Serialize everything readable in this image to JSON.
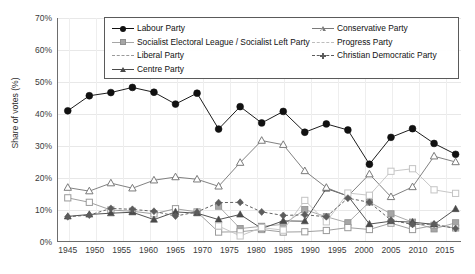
{
  "chart_data": {
    "type": "line",
    "title": "",
    "xlabel": "",
    "ylabel": "Share of votes (%)",
    "xlim": [
      1943,
      2018
    ],
    "ylim": [
      0,
      70
    ],
    "ytick_labels": [
      "0%",
      "10%",
      "20%",
      "30%",
      "40%",
      "50%",
      "60%",
      "70%"
    ],
    "ytick_values": [
      0,
      10,
      20,
      30,
      40,
      50,
      60,
      70
    ],
    "xtick_labels": [
      "1945",
      "1950",
      "1955",
      "1960",
      "1965",
      "1970",
      "1975",
      "1980",
      "1985",
      "1990",
      "1995",
      "2000",
      "2005",
      "2010",
      "2015"
    ],
    "xtick_values": [
      1945,
      1950,
      1955,
      1960,
      1965,
      1970,
      1975,
      1980,
      1985,
      1990,
      1995,
      2000,
      2005,
      2010,
      2015
    ],
    "grid": true,
    "legend_position": "upper-center",
    "election_years": [
      1945,
      1949,
      1953,
      1957,
      1961,
      1965,
      1969,
      1973,
      1977,
      1981,
      1985,
      1989,
      1993,
      1997,
      2001,
      2005,
      2009,
      2013,
      2017
    ],
    "series": [
      {
        "name": "Labour Party",
        "marker": "circle-filled",
        "color": "#111111",
        "line": "solid",
        "x": [
          1945,
          1949,
          1953,
          1957,
          1961,
          1965,
          1969,
          1973,
          1977,
          1981,
          1985,
          1989,
          1993,
          1997,
          2001,
          2005,
          2009,
          2013,
          2017
        ],
        "values": [
          41.0,
          45.7,
          46.7,
          48.3,
          46.8,
          43.1,
          46.5,
          35.3,
          42.3,
          37.2,
          40.8,
          34.3,
          36.9,
          35.0,
          24.3,
          32.7,
          35.4,
          30.8,
          27.4
        ]
      },
      {
        "name": "Socialist Electoral League / Socialist Left Party",
        "marker": "square-filled",
        "color": "#a6a6a6",
        "line": "solid",
        "x": [
          1973,
          1977,
          1981,
          1985,
          1989,
          1993,
          1997,
          2001,
          2005,
          2009,
          2013,
          2017
        ],
        "values": [
          11.2,
          4.2,
          4.9,
          5.5,
          10.1,
          7.9,
          6.0,
          12.5,
          8.8,
          6.2,
          4.1,
          6.0
        ]
      },
      {
        "name": "Liberal Party",
        "marker": "square-open",
        "color": "#9a9a9a",
        "line": "solid",
        "x": [
          1945,
          1949,
          1953,
          1957,
          1961,
          1965,
          1969,
          1973,
          1977,
          1981,
          1985,
          1989,
          1993,
          1997,
          2001,
          2005,
          2009,
          2013,
          2017
        ],
        "values": [
          13.8,
          12.4,
          10.0,
          9.6,
          8.8,
          10.4,
          9.4,
          3.1,
          3.2,
          3.9,
          3.1,
          3.2,
          3.6,
          4.5,
          3.9,
          5.9,
          3.9,
          5.2,
          4.4
        ]
      },
      {
        "name": "Centre Party",
        "marker": "triangle-filled",
        "color": "#4a4a4a",
        "line": "solid",
        "x": [
          1945,
          1949,
          1953,
          1957,
          1961,
          1965,
          1969,
          1973,
          1977,
          1981,
          1985,
          1989,
          1993,
          1997,
          2001,
          2005,
          2009,
          2013,
          2017
        ],
        "values": [
          8.0,
          8.6,
          9.0,
          9.3,
          7.0,
          9.4,
          9.0,
          7.0,
          8.6,
          4.2,
          6.6,
          6.5,
          16.7,
          14.4,
          5.6,
          6.5,
          6.2,
          5.5,
          10.3
        ]
      },
      {
        "name": "Conservative Party",
        "marker": "triangle-open",
        "color": "#7a7a7a",
        "line": "solid",
        "x": [
          1945,
          1949,
          1953,
          1957,
          1961,
          1965,
          1969,
          1973,
          1977,
          1981,
          1985,
          1989,
          1993,
          1997,
          2001,
          2005,
          2009,
          2013,
          2017
        ],
        "values": [
          17.0,
          15.9,
          18.4,
          16.8,
          19.3,
          20.3,
          19.6,
          17.4,
          24.8,
          31.7,
          30.4,
          22.2,
          17.0,
          14.3,
          21.2,
          14.1,
          17.2,
          26.8,
          25.0
        ]
      },
      {
        "name": "Progress Party",
        "marker": "square-open-light",
        "color": "#c4c4c4",
        "line": "solid",
        "x": [
          1973,
          1977,
          1981,
          1985,
          1989,
          1993,
          1997,
          2001,
          2005,
          2009,
          2013,
          2017
        ],
        "values": [
          5.0,
          1.9,
          4.5,
          3.7,
          13.0,
          6.3,
          15.3,
          14.6,
          22.1,
          22.9,
          16.3,
          15.2
        ]
      },
      {
        "name": "Christian Democratic Party",
        "marker": "diamond-filled",
        "color": "#5c5c5c",
        "line": "dashed",
        "x": [
          1945,
          1949,
          1953,
          1957,
          1961,
          1965,
          1969,
          1973,
          1977,
          1981,
          1985,
          1989,
          1993,
          1997,
          2001,
          2005,
          2009,
          2013,
          2017
        ],
        "values": [
          7.9,
          8.4,
          10.5,
          10.2,
          9.6,
          8.1,
          9.4,
          12.3,
          12.4,
          9.4,
          8.3,
          8.5,
          7.9,
          13.7,
          12.4,
          6.8,
          5.5,
          5.6,
          4.2
        ]
      }
    ]
  },
  "legend": {
    "columns": [
      {
        "items": [
          {
            "label": "Labour Party",
            "marker": "circle-filled",
            "line": "solid",
            "color": "#111111"
          },
          {
            "label": "Socialist Electoral League / Socialist Left Party",
            "marker": "square-filled",
            "line": "solid",
            "color": "#a6a6a6"
          },
          {
            "label": "Liberal Party",
            "marker": "none",
            "line": "dashdot",
            "color": "#9a9a9a"
          },
          {
            "label": "Centre Party",
            "marker": "triangle-filled",
            "line": "solid",
            "color": "#4a4a4a"
          }
        ]
      },
      {
        "items": [
          {
            "label": "Conservative Party",
            "marker": "triangle-open",
            "line": "solid",
            "color": "#7a7a7a"
          },
          {
            "label": "Progress Party",
            "marker": "none",
            "line": "dashdot",
            "color": "#bdbdbd"
          },
          {
            "label": "Christian Democratic Party",
            "marker": "plus",
            "line": "dashed",
            "color": "#5c5c5c"
          }
        ]
      }
    ]
  }
}
